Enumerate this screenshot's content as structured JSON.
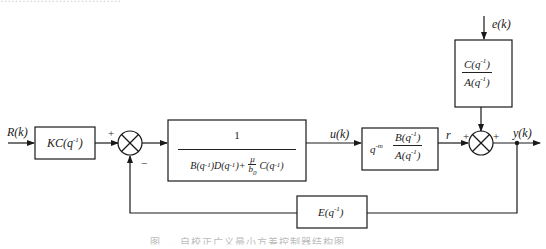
{
  "top_text_clipped": "……………………………",
  "caption": "图 … 自校正广义最小方差控制器结构图",
  "signals": {
    "input": "R(k)",
    "control": "u(k)",
    "intermediate": "r",
    "noise": "e(k)",
    "output": "y(k)"
  },
  "blocks": {
    "prefilter": {
      "label": "KC(q",
      "exp": "-1",
      "close": ")"
    },
    "controller": {
      "numerator": "1",
      "denominator_parts": [
        "B(q",
        "-1",
        ")D(q",
        "-1",
        ")+",
        "μ",
        "b",
        "0",
        "C(q",
        "-1",
        ")"
      ]
    },
    "plant": {
      "delay": "q",
      "delay_exp": "-m",
      "numerator": "B(q",
      "num_exp": "-1",
      "denominator": "A(q",
      "den_exp": "-1"
    },
    "noise_filter": {
      "numerator": "C(q",
      "num_exp": "-1",
      "denominator": "A(q",
      "den_exp": "-1"
    },
    "feedback": {
      "label": "E(q",
      "exp": "-1"
    }
  },
  "summing_junctions": {
    "sum1": {
      "signs": {
        "left": "+",
        "bottom": "−"
      }
    },
    "sum2": {
      "signs": {
        "left": "+",
        "top": "+"
      }
    }
  }
}
